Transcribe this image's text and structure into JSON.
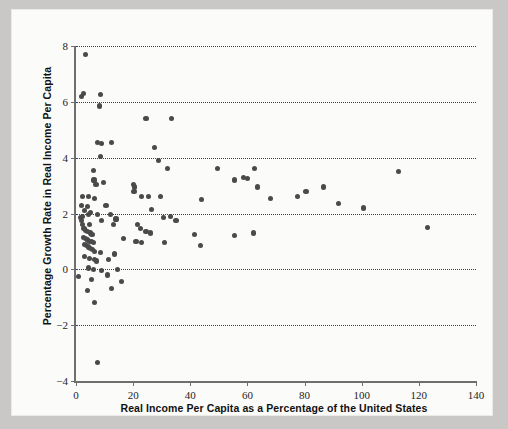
{
  "chart_data": {
    "type": "scatter",
    "title": "",
    "xlabel": "Real Income Per Capita as a Percentage of the United States",
    "ylabel": "Percentage Growth Rate in Real Income Per Capita",
    "xlim": [
      0,
      140
    ],
    "ylim": [
      -4,
      8
    ],
    "xticks": [
      0,
      20,
      40,
      60,
      80,
      100,
      120,
      140
    ],
    "yticks": [
      -4,
      -2,
      0,
      2,
      4,
      6,
      8
    ],
    "gridlines": {
      "y": [
        -2,
        0,
        2,
        4,
        6,
        8
      ],
      "x": [],
      "style": "dotted",
      "color": "#3b3b6b"
    },
    "legend": null,
    "marker": {
      "shape": "circle",
      "color": "#4a4a4a",
      "size_px": 5.2
    },
    "n_points": 110,
    "points": [
      [
        3.2,
        7.7
      ],
      [
        1.8,
        6.2
      ],
      [
        2.5,
        6.3
      ],
      [
        8.5,
        6.25
      ],
      [
        8.2,
        5.85
      ],
      [
        24.5,
        5.4
      ],
      [
        33.5,
        5.4
      ],
      [
        7.5,
        4.55
      ],
      [
        8.8,
        4.5
      ],
      [
        12.5,
        4.55
      ],
      [
        27.5,
        4.35
      ],
      [
        8.6,
        4.05
      ],
      [
        29.0,
        3.9
      ],
      [
        6.0,
        3.55
      ],
      [
        32.0,
        3.6
      ],
      [
        49.5,
        3.6
      ],
      [
        62.5,
        3.6
      ],
      [
        113.0,
        3.5
      ],
      [
        6.3,
        3.2
      ],
      [
        7.0,
        3.05
      ],
      [
        9.5,
        3.1
      ],
      [
        20.0,
        3.05
      ],
      [
        20.6,
        2.95
      ],
      [
        20.3,
        2.8
      ],
      [
        55.5,
        3.2
      ],
      [
        58.5,
        3.3
      ],
      [
        60.0,
        3.25
      ],
      [
        63.5,
        2.95
      ],
      [
        2.2,
        2.6
      ],
      [
        4.5,
        2.6
      ],
      [
        6.5,
        2.55
      ],
      [
        23.0,
        2.6
      ],
      [
        25.5,
        2.6
      ],
      [
        29.5,
        2.6
      ],
      [
        44.0,
        2.5
      ],
      [
        68.0,
        2.55
      ],
      [
        77.5,
        2.6
      ],
      [
        80.5,
        2.8
      ],
      [
        86.5,
        2.95
      ],
      [
        100.5,
        2.2
      ],
      [
        92.0,
        2.35
      ],
      [
        2.0,
        2.3
      ],
      [
        4.0,
        2.25
      ],
      [
        10.5,
        2.3
      ],
      [
        3.0,
        2.1
      ],
      [
        5.2,
        2.05
      ],
      [
        2.4,
        1.9
      ],
      [
        4.3,
        1.95
      ],
      [
        7.5,
        1.95
      ],
      [
        12.0,
        1.95
      ],
      [
        26.5,
        2.15
      ],
      [
        1.5,
        1.85
      ],
      [
        2.0,
        1.75
      ],
      [
        9.0,
        1.75
      ],
      [
        14.0,
        1.8
      ],
      [
        30.5,
        1.85
      ],
      [
        33.0,
        1.9
      ],
      [
        35.0,
        1.75
      ],
      [
        123.0,
        1.5
      ],
      [
        2.3,
        1.6
      ],
      [
        4.7,
        1.6
      ],
      [
        13.0,
        1.6
      ],
      [
        21.5,
        1.6
      ],
      [
        22.5,
        1.45
      ],
      [
        2.8,
        1.45
      ],
      [
        3.4,
        1.4
      ],
      [
        3.9,
        1.35
      ],
      [
        5.0,
        1.3
      ],
      [
        5.6,
        1.25
      ],
      [
        24.5,
        1.35
      ],
      [
        26.0,
        1.3
      ],
      [
        41.5,
        1.25
      ],
      [
        55.5,
        1.2
      ],
      [
        62.0,
        1.3
      ],
      [
        2.6,
        1.15
      ],
      [
        3.2,
        1.1
      ],
      [
        4.1,
        1.05
      ],
      [
        4.6,
        1.0
      ],
      [
        5.3,
        1.0
      ],
      [
        6.0,
        0.95
      ],
      [
        16.5,
        1.1
      ],
      [
        21.0,
        1.0
      ],
      [
        23.0,
        0.95
      ],
      [
        31.0,
        0.95
      ],
      [
        43.5,
        0.85
      ],
      [
        2.9,
        0.9
      ],
      [
        3.6,
        0.85
      ],
      [
        4.3,
        0.8
      ],
      [
        5.0,
        0.75
      ],
      [
        5.8,
        0.7
      ],
      [
        6.4,
        0.65
      ],
      [
        13.5,
        0.55
      ],
      [
        8.5,
        0.6
      ],
      [
        3.0,
        0.45
      ],
      [
        4.8,
        0.4
      ],
      [
        6.5,
        0.35
      ],
      [
        7.2,
        0.3
      ],
      [
        11.5,
        0.35
      ],
      [
        1.0,
        -0.25
      ],
      [
        4.5,
        0.05
      ],
      [
        6.2,
        0.0
      ],
      [
        9.0,
        -0.05
      ],
      [
        14.5,
        0.0
      ],
      [
        5.5,
        -0.35
      ],
      [
        11.0,
        -0.2
      ],
      [
        16.0,
        -0.45
      ],
      [
        4.0,
        -0.75
      ],
      [
        12.5,
        -0.7
      ],
      [
        6.5,
        -1.2
      ],
      [
        7.5,
        -3.35
      ]
    ]
  },
  "colors": {
    "page_background": "#c9c8c6",
    "card_background": "#fbfbfa",
    "axis": "#6f6f6f",
    "grid": "#3b3b6b",
    "marker": "#4a4a4a",
    "text": "#1d1d1d"
  }
}
